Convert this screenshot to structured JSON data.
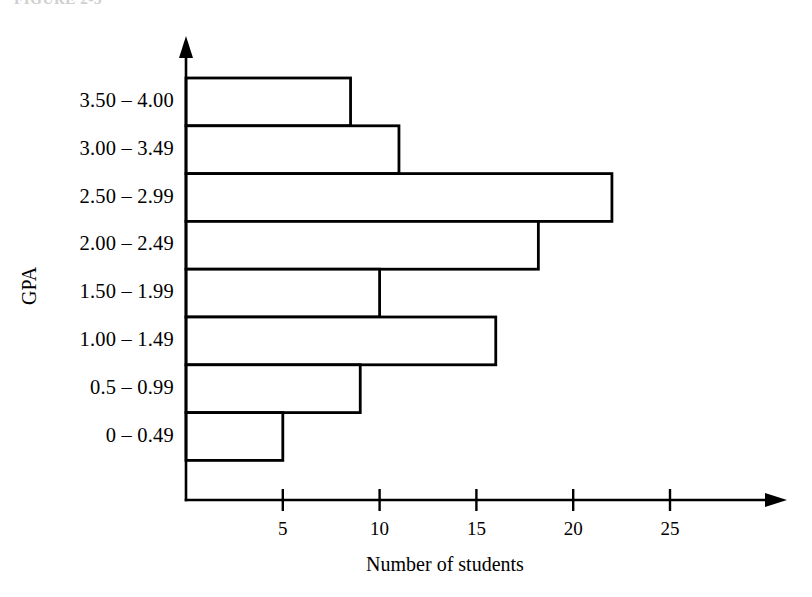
{
  "figure": {
    "caption_partial": "FIGURE 2-3"
  },
  "chart_data": {
    "type": "bar",
    "orientation": "horizontal",
    "title": "",
    "xlabel": "Number of students",
    "ylabel": "GPA",
    "categories": [
      "3.50 – 4.00",
      "3.00 – 3.49",
      "2.50 – 2.99",
      "2.00 – 2.49",
      "1.50 – 1.99",
      "1.00 – 1.49",
      "0.5 – 0.99",
      "0 – 0.49"
    ],
    "values": [
      8.5,
      11,
      22,
      18.2,
      10,
      16,
      9,
      5
    ],
    "xticks": [
      5,
      10,
      15,
      20,
      25
    ],
    "xticklabels": [
      "5",
      "10",
      "15",
      "20",
      "25"
    ],
    "xlim": [
      0,
      29
    ],
    "grid": false,
    "legend": null,
    "bar_fill_color": "#ffffff",
    "bar_edge_color": "#000000",
    "axis_color": "#000000",
    "background_color": "#ffffff"
  }
}
